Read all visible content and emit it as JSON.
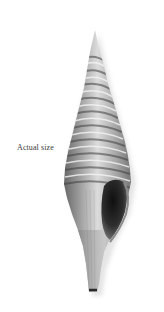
{
  "caption": {
    "label": "Actual size"
  },
  "specimen": {
    "kind": "spindle-shell",
    "colors": {
      "background": "#ffffff",
      "shell_light": "#e6e6e6",
      "shell_mid": "#a8a8a8",
      "shell_dark": "#4a4a4a",
      "aperture": "#1e1e1e"
    }
  }
}
